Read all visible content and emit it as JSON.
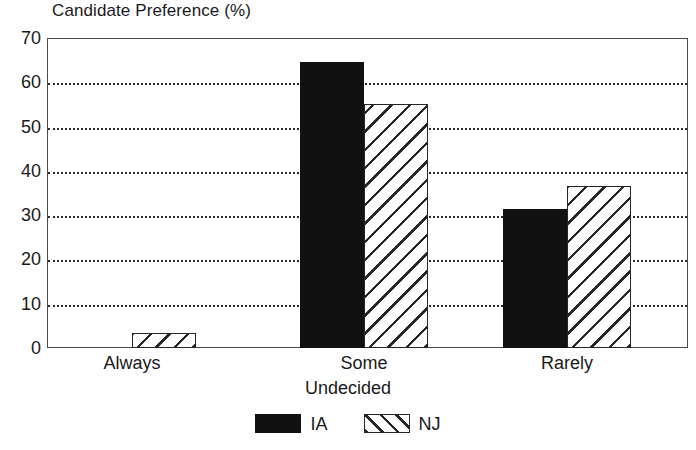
{
  "chart_data": {
    "type": "bar",
    "title": "Candidate Preference (%)",
    "xlabel": "Undecided",
    "ylabel": "",
    "categories": [
      "Always",
      "Some",
      "Rarely"
    ],
    "series": [
      {
        "name": "IA",
        "values": [
          0,
          64.5,
          31.5
        ],
        "color": "#111111",
        "fill": "solid-black"
      },
      {
        "name": "NJ",
        "values": [
          3.4,
          55,
          36.5
        ],
        "color": "#262626",
        "fill": "diagonal-hatch"
      }
    ],
    "ylim": [
      0,
      70
    ],
    "yticks": [
      0,
      10,
      20,
      30,
      40,
      50,
      60,
      70
    ],
    "ytick_labels": [
      "0",
      "10",
      "20",
      "30",
      "40",
      "50",
      "60",
      "70"
    ],
    "grid": true,
    "grid_style": "dotted-horizontal",
    "legend_position": "bottom-center",
    "legend_entries": [
      "IA",
      "NJ"
    ]
  },
  "legend": {
    "items": [
      {
        "label": "IA",
        "swatch": "solid-black-swatch"
      },
      {
        "label": "NJ",
        "swatch": "hatched-swatch"
      }
    ]
  }
}
